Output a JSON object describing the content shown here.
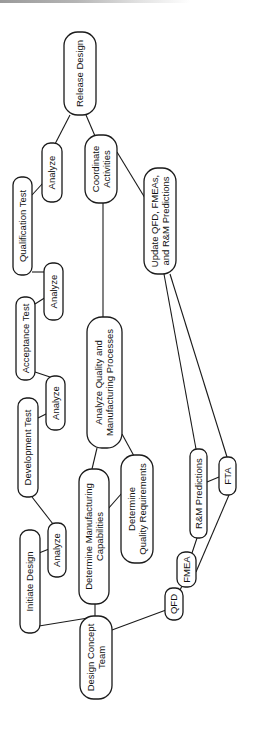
{
  "diagram": {
    "type": "flow-network",
    "orientation": "rotated-90-ccw",
    "colors": {
      "stroke": "#1a1a1a",
      "fill": "#ffffff",
      "text": "#111111"
    },
    "nodes": [
      {
        "id": "release",
        "label": [
          "Release Design"
        ],
        "x": 64,
        "y": 32,
        "w": 32,
        "h": 83
      },
      {
        "id": "analyze1",
        "label": [
          "Analyze"
        ],
        "x": 42,
        "y": 143,
        "w": 20,
        "h": 59
      },
      {
        "id": "coordinate",
        "label": [
          "Coordinate",
          "Activities"
        ],
        "x": 85,
        "y": 135,
        "w": 32,
        "h": 68
      },
      {
        "id": "qualification",
        "label": [
          "Qualification Test"
        ],
        "x": 13,
        "y": 177,
        "w": 19,
        "h": 98
      },
      {
        "id": "update",
        "label": [
          "Update QFD, FMEAs,",
          "and R&M Predictions"
        ],
        "x": 144,
        "y": 168,
        "w": 32,
        "h": 106
      },
      {
        "id": "analyze2",
        "label": [
          "Analyze"
        ],
        "x": 44,
        "y": 263,
        "w": 19,
        "h": 57
      },
      {
        "id": "acceptance",
        "label": [
          "Acceptance Test"
        ],
        "x": 16,
        "y": 297,
        "w": 19,
        "h": 83
      },
      {
        "id": "analyzeQM",
        "label": [
          "Analyze Quality and",
          "Manufacturing Processes"
        ],
        "x": 87,
        "y": 317,
        "w": 35,
        "h": 131
      },
      {
        "id": "analyze3",
        "label": [
          "Analyze"
        ],
        "x": 46,
        "y": 376,
        "w": 19,
        "h": 54
      },
      {
        "id": "development",
        "label": [
          "Development Test"
        ],
        "x": 18,
        "y": 398,
        "w": 20,
        "h": 99
      },
      {
        "id": "rmpred",
        "label": [
          "R&M Predictions"
        ],
        "x": 190,
        "y": 449,
        "w": 17,
        "h": 89
      },
      {
        "id": "fta",
        "label": [
          "FTA"
        ],
        "x": 219,
        "y": 457,
        "w": 17,
        "h": 38
      },
      {
        "id": "detquality",
        "label": [
          "Determine",
          "Quality Requirements"
        ],
        "x": 121,
        "y": 455,
        "w": 32,
        "h": 108
      },
      {
        "id": "detmfg",
        "label": [
          "Determine Manufacturing",
          "Capabilities"
        ],
        "x": 79,
        "y": 469,
        "w": 30,
        "h": 135
      },
      {
        "id": "analyze4",
        "label": [
          "Analyze"
        ],
        "x": 48,
        "y": 523,
        "w": 18,
        "h": 54
      },
      {
        "id": "initiate",
        "label": [
          "Initiate Design"
        ],
        "x": 20,
        "y": 530,
        "w": 20,
        "h": 103
      },
      {
        "id": "fmea",
        "label": [
          "FMEA"
        ],
        "x": 177,
        "y": 552,
        "w": 19,
        "h": 35
      },
      {
        "id": "qfd",
        "label": [
          "QFD"
        ],
        "x": 165,
        "y": 588,
        "w": 18,
        "h": 32
      },
      {
        "id": "dct",
        "label": [
          "Design Concept",
          "Team"
        ],
        "x": 80,
        "y": 616,
        "w": 32,
        "h": 83
      }
    ],
    "edges": [
      {
        "from": "dct",
        "to": "initiate",
        "pts": [
          [
            88,
            618
          ],
          [
            39,
            626
          ]
        ]
      },
      {
        "from": "dct",
        "to": "detmfg",
        "pts": [
          [
            95,
            616
          ],
          [
            95,
            604
          ]
        ]
      },
      {
        "from": "dct",
        "to": "qfd",
        "pts": [
          [
            112,
            630
          ],
          [
            166,
            610
          ]
        ]
      },
      {
        "from": "initiate",
        "to": "analyze4",
        "pts": [
          [
            39,
            553
          ],
          [
            49,
            549
          ]
        ]
      },
      {
        "from": "analyze4",
        "to": "development",
        "pts": [
          [
            53,
            524
          ],
          [
            32,
            497
          ]
        ]
      },
      {
        "from": "development",
        "to": "analyze3",
        "pts": [
          [
            38,
            418
          ],
          [
            48,
            413
          ]
        ]
      },
      {
        "from": "analyze3",
        "to": "acceptance",
        "pts": [
          [
            50,
            377
          ],
          [
            35,
            372
          ]
        ]
      },
      {
        "from": "acceptance",
        "to": "analyze2",
        "pts": [
          [
            35,
            304
          ],
          [
            46,
            297
          ]
        ]
      },
      {
        "from": "analyze2",
        "to": "qualification",
        "pts": [
          [
            46,
            272
          ],
          [
            32,
            272
          ]
        ]
      },
      {
        "from": "qualification",
        "to": "analyze1",
        "pts": [
          [
            32,
            195
          ],
          [
            43,
            183
          ]
        ]
      },
      {
        "from": "analyze1",
        "to": "release",
        "pts": [
          [
            55,
            144
          ],
          [
            70,
            115
          ]
        ]
      },
      {
        "from": "release",
        "to": "coordinate",
        "pts": [
          [
            86,
            115
          ],
          [
            95,
            136
          ]
        ]
      },
      {
        "from": "detmfg",
        "to": "analyzeQM",
        "pts": [
          [
            92,
            469
          ],
          [
            97,
            448
          ]
        ]
      },
      {
        "from": "detmfg",
        "to": "detquality",
        "pts": [
          [
            107,
            510
          ],
          [
            122,
            493
          ]
        ]
      },
      {
        "from": "analyzeQM",
        "to": "detquality",
        "pts": [
          [
            122,
            434
          ],
          [
            134,
            456
          ]
        ]
      },
      {
        "from": "analyzeQM",
        "to": "coordinate",
        "pts": [
          [
            103,
            317
          ],
          [
            103,
            203
          ]
        ]
      },
      {
        "from": "coordinate",
        "to": "update",
        "pts": [
          [
            117,
            152
          ],
          [
            145,
            198
          ]
        ]
      },
      {
        "from": "qfd",
        "to": "fmea",
        "pts": [
          [
            180,
            590
          ],
          [
            182,
            586
          ]
        ]
      },
      {
        "from": "fmea",
        "to": "rmpred",
        "pts": [
          [
            192,
            553
          ],
          [
            197,
            538
          ]
        ]
      },
      {
        "from": "fmea",
        "to": "fta",
        "pts": [
          [
            196,
            572
          ],
          [
            229,
            495
          ]
        ]
      },
      {
        "from": "rmpred",
        "to": "fta",
        "pts": [
          [
            207,
            482
          ],
          [
            219,
            477
          ]
        ]
      },
      {
        "from": "rmpred",
        "to": "update",
        "pts": [
          [
            196,
            449
          ],
          [
            164,
            274
          ]
        ]
      },
      {
        "from": "fta",
        "to": "update",
        "pts": [
          [
            227,
            457
          ],
          [
            170,
            274
          ]
        ]
      }
    ]
  }
}
